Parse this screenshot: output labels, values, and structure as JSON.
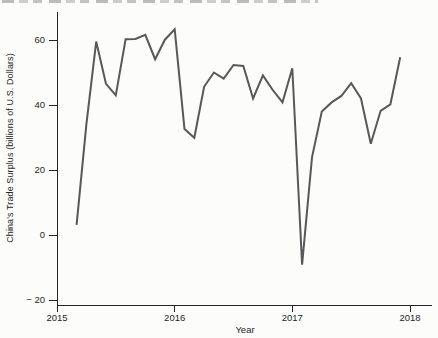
{
  "window": {
    "width": 438,
    "height": 338,
    "background": "#fcfcfb"
  },
  "clipped_caption": {
    "present": true,
    "legible": false
  },
  "chart_data": {
    "type": "line",
    "title": "",
    "xlabel": "Year",
    "ylabel": "China's Trade Surplus (billions of U.S. Dollars)",
    "frequency": "monthly",
    "grid": false,
    "legend": "none",
    "line_color": "#58585a",
    "axis_color": "#262626",
    "xlim": [
      2015,
      2018.19
    ],
    "ylim": [
      -21.5,
      68.5
    ],
    "xticks": [
      {
        "value": 2015,
        "label": "2015"
      },
      {
        "value": 2016,
        "label": "2016"
      },
      {
        "value": 2017,
        "label": "2017"
      },
      {
        "value": 2018,
        "label": "2018"
      }
    ],
    "yticks": [
      {
        "value": 60,
        "label": "60"
      },
      {
        "value": 40,
        "label": "40"
      },
      {
        "value": 20,
        "label": "20"
      },
      {
        "value": 0,
        "label": "0"
      },
      {
        "value": -20,
        "label": "− 20"
      }
    ],
    "series": [
      {
        "name": "China's trade surplus",
        "x": [
          "2015-03",
          "2015-04",
          "2015-05",
          "2015-06",
          "2015-07",
          "2015-08",
          "2015-09",
          "2015-10",
          "2015-11",
          "2015-12",
          "2016-01",
          "2016-02",
          "2016-03",
          "2016-04",
          "2016-05",
          "2016-06",
          "2016-07",
          "2016-08",
          "2016-09",
          "2016-10",
          "2016-11",
          "2016-12",
          "2017-01",
          "2017-02",
          "2017-03",
          "2017-04",
          "2017-05",
          "2017-06",
          "2017-07",
          "2017-08",
          "2017-09",
          "2017-10",
          "2017-11",
          "2017-12"
        ],
        "values": [
          3.1,
          34.1,
          59.5,
          46.5,
          43.0,
          60.2,
          60.3,
          61.6,
          54.1,
          60.1,
          63.3,
          32.6,
          29.9,
          45.6,
          50.0,
          48.1,
          52.3,
          52.0,
          42.0,
          49.1,
          44.6,
          40.8,
          51.3,
          -9.1,
          23.9,
          38.0,
          40.8,
          42.8,
          46.7,
          42.0,
          28.1,
          38.2,
          40.2,
          54.7
        ]
      }
    ]
  }
}
